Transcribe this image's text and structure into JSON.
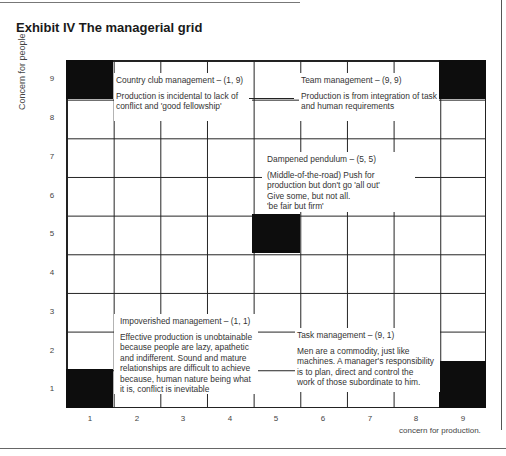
{
  "title": "Exhibit IV The managerial grid",
  "axes": {
    "y_label": "Concern for people",
    "x_label": "concern for production.",
    "y_ticks": [
      "9",
      "8",
      "7",
      "6",
      "5",
      "4",
      "3",
      "2",
      "1"
    ],
    "x_ticks": [
      "1",
      "2",
      "3",
      "4",
      "5",
      "6",
      "7",
      "8",
      "9"
    ]
  },
  "styles": [
    {
      "name": "Country club management – (1, 9)",
      "description": "Production is incidental to lack of conflict and 'good fellowship'"
    },
    {
      "name": "Team management – (9, 9)",
      "description": "Production is from integration of task and human requirements"
    },
    {
      "name": "Dampened pendulum – (5, 5)",
      "description_lines": [
        "(Middle-of-the-road) Push for",
        "production but don't go 'all out'",
        "Give some, but not all.",
        "'be fair but firm'"
      ]
    },
    {
      "name": "Impoverished management – (1, 1)",
      "description_lines": [
        "Effective production is unobtainable",
        "because people are lazy, apathetic",
        "and indifferent. Sound and mature",
        "relationships are difficult to achieve",
        "because, human nature being what",
        "it is, conflict is inevitable"
      ]
    },
    {
      "name": "Task management – (9, 1)",
      "description_lines": [
        "Men are a commodity, just like",
        "machines. A manager's responsibility",
        "is to plan, direct and control the",
        "work of those subordinate to him."
      ]
    }
  ],
  "highlighted_cells": [
    {
      "x": 1,
      "y": 9
    },
    {
      "x": 9,
      "y": 9
    },
    {
      "x": 5,
      "y": 5
    },
    {
      "x": 1,
      "y": 1
    },
    {
      "x": 9,
      "y": 1
    }
  ],
  "colors": {
    "cell_fill": "#0d0d0d",
    "grid_line": "#222222",
    "text": "#333333"
  }
}
